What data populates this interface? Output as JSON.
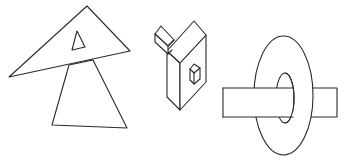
{
  "figure": {
    "description": "Three line-drawn figures on white background: overlapping triangles, an isometric block shape with a small cube, and a ring pierced by a rectangular bar",
    "stroke_color": "#2a2a2a",
    "background_color": "#ffffff",
    "shapes": [
      {
        "id": "triangles",
        "label": "Overlapping triangles",
        "big_triangle": [
          [
            87,
            6
          ],
          [
            130,
            51
          ],
          [
            9,
            77
          ]
        ],
        "inner_triangle": [
          [
            77,
            31
          ],
          [
            85,
            47
          ],
          [
            72,
            50
          ]
        ],
        "lower_triangle": [
          [
            69,
            65
          ],
          [
            93,
            60
          ],
          [
            127,
            128
          ],
          [
            52,
            125
          ]
        ]
      },
      {
        "id": "isometric-block",
        "label": "Isometric block with small cube"
      },
      {
        "id": "ring-and-bar",
        "label": "Ring pierced by rectangular bar",
        "outer_ellipse": {
          "cx": 283.5,
          "cy": 95.5,
          "rx": 29.5,
          "ry": 59.5
        },
        "inner_ellipse": {
          "cx": 285,
          "cy": 98,
          "rx": 9,
          "ry": 25
        },
        "bar": {
          "x1": 223,
          "y1": 88,
          "x2": 337,
          "y2": 117
        }
      }
    ]
  }
}
